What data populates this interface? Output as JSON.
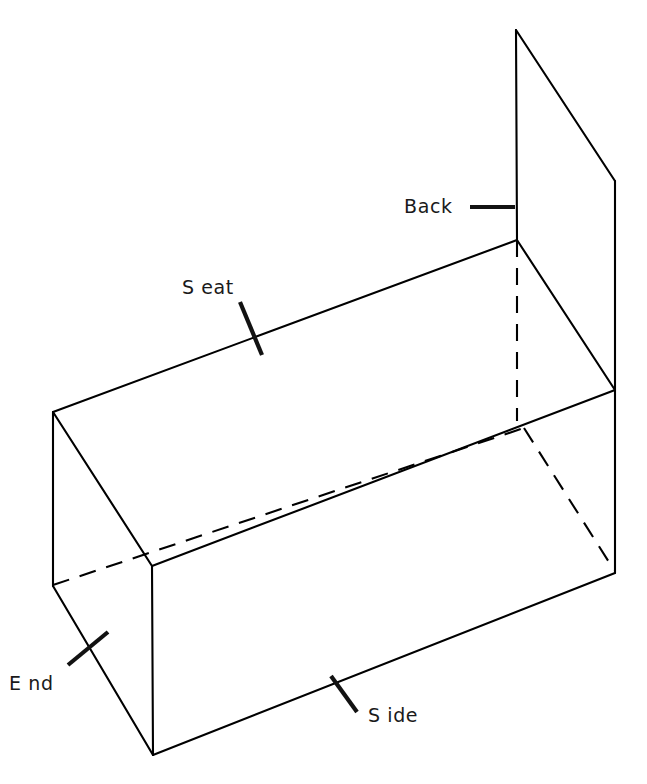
{
  "figure": {
    "background_color": "#ffffff",
    "line_color": "#000000",
    "label_color": "#1a1a1a",
    "width": 647,
    "height": 784,
    "projection": "isometric"
  },
  "labels": {
    "back": "Back",
    "seat": "S eat",
    "side": "S ide",
    "end": "E nd"
  },
  "parts": [
    {
      "key": "back",
      "label": "Back",
      "description": "upright back panel"
    },
    {
      "key": "seat",
      "label": "Seat",
      "description": "horizontal seat surface"
    },
    {
      "key": "side",
      "label": "Side",
      "description": "long front side panel"
    },
    {
      "key": "end",
      "label": "End",
      "description": "short left end panel"
    }
  ],
  "geometry": {
    "back_panel": {
      "top_left": [
        516,
        30
      ],
      "top_right": [
        615,
        181
      ],
      "bottom_right": [
        615,
        390
      ],
      "bottom_left": [
        517,
        240
      ]
    },
    "seat_face": {
      "back_left": [
        53,
        412
      ],
      "back_right": [
        517,
        240
      ],
      "front_right": [
        615,
        390
      ],
      "front_left": [
        152,
        566
      ]
    },
    "side_face": {
      "top_left": [
        152,
        566
      ],
      "top_right": [
        615,
        390
      ],
      "bottom_right": [
        615,
        573
      ],
      "bottom_left": [
        153,
        755
      ]
    },
    "end_face": {
      "top_back": [
        53,
        412
      ],
      "top_front": [
        152,
        566
      ],
      "bottom_front": [
        153,
        755
      ],
      "bottom_back": [
        53,
        586
      ]
    },
    "hidden_edges": [
      {
        "name": "back-panel-inner-vertical",
        "from": [
          517,
          240
        ],
        "to": [
          517,
          421
        ]
      },
      {
        "name": "far-bottom-long-edge",
        "from": [
          53,
          585
        ],
        "to": [
          524,
          428
        ]
      },
      {
        "name": "far-right-bottom-diagonal",
        "from": [
          524,
          428
        ],
        "to": [
          614,
          570
        ]
      }
    ]
  },
  "leaders": {
    "back": {
      "line_from": [
        470,
        207
      ],
      "line_to": [
        515,
        207
      ],
      "text_anchor": [
        404,
        213
      ]
    },
    "seat": {
      "tick_from": [
        240,
        302
      ],
      "tick_to": [
        262,
        355
      ],
      "text_anchor": [
        182,
        294
      ]
    },
    "side": {
      "tick_from": [
        331,
        676
      ],
      "tick_to": [
        357,
        712
      ],
      "text_anchor": [
        368,
        722
      ]
    },
    "end": {
      "tick_from": [
        68,
        665
      ],
      "tick_to": [
        108,
        632
      ],
      "text_anchor": [
        9,
        690
      ]
    }
  }
}
